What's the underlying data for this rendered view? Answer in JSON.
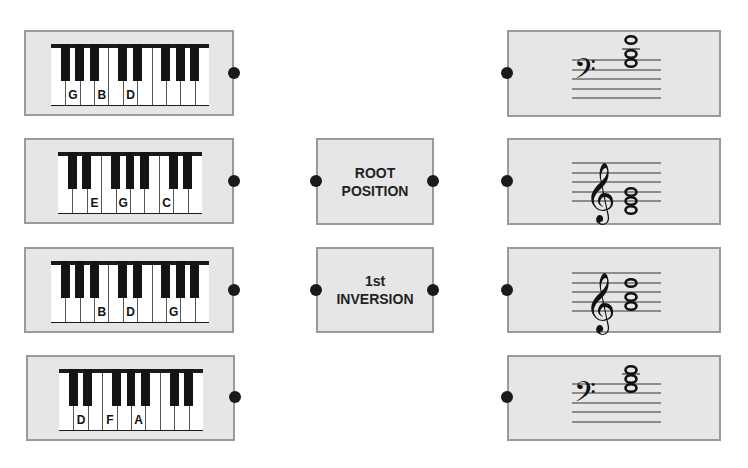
{
  "colors": {
    "card_bg": "#e6e6e6",
    "card_border": "#9a9a9a",
    "dot": "#1a1a1a",
    "black_key": "#141414",
    "white_key": "#ffffff"
  },
  "keyboards": [
    {
      "id": "kb1",
      "white_keys": [
        "F",
        "G",
        "A",
        "B",
        "C",
        "D",
        "E",
        "F",
        "G",
        "A",
        "B"
      ],
      "labels": {
        "1": "G",
        "3": "B",
        "5": "D"
      },
      "label_list": [
        "G",
        "B",
        "D"
      ]
    },
    {
      "id": "kb2",
      "white_keys": [
        "C",
        "D",
        "E",
        "F",
        "G",
        "A",
        "B",
        "C",
        "D",
        "E"
      ],
      "labels": {
        "2": "E",
        "4": "G",
        "7": "C"
      },
      "label_list": [
        "E",
        "G",
        "C"
      ]
    },
    {
      "id": "kb3",
      "white_keys": [
        "F",
        "G",
        "A",
        "B",
        "C",
        "D",
        "E",
        "F",
        "G",
        "A",
        "B"
      ],
      "labels": {
        "3": "B",
        "5": "D",
        "8": "G"
      },
      "label_list": [
        "B",
        "D",
        "G"
      ]
    },
    {
      "id": "kb4",
      "white_keys": [
        "C",
        "D",
        "E",
        "F",
        "G",
        "A",
        "B",
        "C",
        "D",
        "E"
      ],
      "labels": {
        "1": "D",
        "3": "F",
        "5": "A"
      },
      "label_list": [
        "D",
        "F",
        "A"
      ]
    }
  ],
  "categories": [
    {
      "line1": "ROOT",
      "line2": "POSITION"
    },
    {
      "line1": "1st",
      "line2": "INVERSION"
    }
  ],
  "staves": [
    {
      "clef": "bass",
      "chord": "G-B-D (1st inversion, B in bass)",
      "notes_desc": "three whole notes stacked above staff with ledger line"
    },
    {
      "clef": "treble",
      "chord": "C-E-G (root position)",
      "notes_desc": "three whole notes stacked on lower lines/spaces"
    },
    {
      "clef": "treble",
      "chord": "D-F-A... (1st inversion)",
      "notes_desc": "three whole notes middle of staff"
    },
    {
      "clef": "bass",
      "chord": "triad in upper staff",
      "notes_desc": "three whole notes stacked at top of staff"
    }
  ]
}
